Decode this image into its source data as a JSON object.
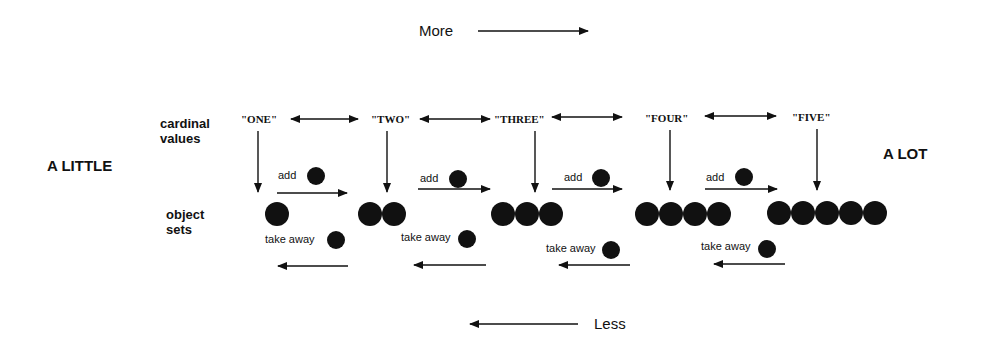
{
  "direction": {
    "more": "More",
    "less": "Less"
  },
  "ends": {
    "left": "A LITTLE",
    "right": "A LOT"
  },
  "rows": {
    "cardinal": [
      "cardinal",
      "values"
    ],
    "objects": [
      "object",
      "sets"
    ]
  },
  "cardinals": [
    "\"ONE\"",
    "\"TWO\"",
    "\"THREE\"",
    "\"FOUR\"",
    "\"FIVE\""
  ],
  "set_sizes": [
    1,
    2,
    3,
    4,
    5
  ],
  "ops": {
    "add": "add",
    "take_away": "take away"
  }
}
